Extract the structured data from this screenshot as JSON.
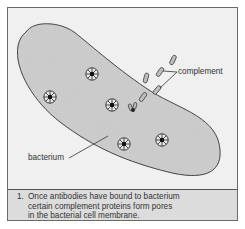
{
  "figure": {
    "labels": {
      "complement": "complement",
      "bacterium": "bacterium"
    },
    "caption": {
      "number": "1.",
      "lines": [
        "Once antibodies have bound to bacterium",
        "certain complement proteins form pores",
        "in the bacterial cell membrane."
      ]
    },
    "elements": {
      "pores": [
        {
          "x": 92,
          "y": 74
        },
        {
          "x": 50,
          "y": 97
        },
        {
          "x": 112,
          "y": 105
        },
        {
          "x": 124,
          "y": 144
        },
        {
          "x": 162,
          "y": 140
        }
      ],
      "complement_proteins": 5
    },
    "colors": {
      "background": "#f0f0f0",
      "bacterium_fill": "#cfcfcf",
      "outline": "#3a3a3a",
      "caption_bg": "#dcdcdc"
    }
  }
}
